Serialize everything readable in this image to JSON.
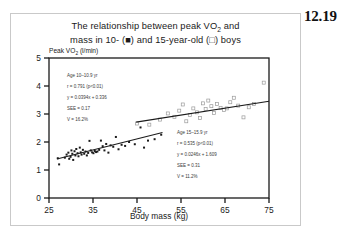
{
  "page": {
    "number_label": "12.19"
  },
  "figure": {
    "title_line1": "The relationship between peak VO",
    "title_line1_sub": "2",
    "title_line1_end": " and",
    "title_line2_a": "mass in 10- (",
    "title_line2_marker_filled": "■",
    "title_line2_b": ") and 15-year-old (",
    "title_line2_marker_open": "□",
    "title_line2_c": ") boys",
    "y_axis_label": "Peak VO",
    "y_axis_label_sub": "2",
    "y_axis_label_unit": " (l/min)",
    "x_axis_label": "Body mass (kg)"
  },
  "annotations": {
    "group_10yr": {
      "line1": "Age 10–10.9 yr",
      "line2": "r = 0.791 (p<0.01)",
      "line3": "y = 0.0394x + 0.336",
      "line4": "SEE = 0.17",
      "line5": "V = 16.2%"
    },
    "group_15yr": {
      "line1": "Age 15–15.9 yr",
      "line2": "r = 0.535 (p<0.01)",
      "line3": "y = 0.0246x + 1.609",
      "line4": "SEE = 0.31",
      "line5": "V = 11.2%"
    }
  },
  "chart_data": {
    "type": "scatter",
    "xlabel": "Body mass (kg)",
    "ylabel": "Peak VO2 (l/min)",
    "xlim": [
      25,
      75
    ],
    "ylim": [
      0,
      5
    ],
    "xticks": [
      25,
      35,
      45,
      55,
      65,
      75
    ],
    "yticks": [
      0,
      1,
      2,
      3,
      4,
      5
    ],
    "grid": false,
    "legend_position": "in-title",
    "series": [
      {
        "name": "Age 10-10.9 yr",
        "marker": "filled-square",
        "color": "#1a1a1a",
        "regression": {
          "slope": 0.0394,
          "intercept": 0.336,
          "r": 0.791,
          "p": "<0.01",
          "see": 0.17,
          "v_percent": 16.2,
          "x_start": 26.8,
          "x_end": 50.8
        },
        "points": [
          [
            27.0,
            1.42
          ],
          [
            27.3,
            1.2
          ],
          [
            28.6,
            1.44
          ],
          [
            29.0,
            1.55
          ],
          [
            29.4,
            1.62
          ],
          [
            29.6,
            1.4
          ],
          [
            29.9,
            1.47
          ],
          [
            30.1,
            1.7
          ],
          [
            30.3,
            1.58
          ],
          [
            30.5,
            1.36
          ],
          [
            30.8,
            1.67
          ],
          [
            31.0,
            1.52
          ],
          [
            31.2,
            1.75
          ],
          [
            31.5,
            1.6
          ],
          [
            31.7,
            1.49
          ],
          [
            32.0,
            1.8
          ],
          [
            32.2,
            1.63
          ],
          [
            32.4,
            1.55
          ],
          [
            32.7,
            1.72
          ],
          [
            33.0,
            1.58
          ],
          [
            33.3,
            1.66
          ],
          [
            33.6,
            1.52
          ],
          [
            33.9,
            1.61
          ],
          [
            34.2,
            2.04
          ],
          [
            34.5,
            1.7
          ],
          [
            34.8,
            1.63
          ],
          [
            35.1,
            1.6
          ],
          [
            35.4,
            1.68
          ],
          [
            35.7,
            1.64
          ],
          [
            36.0,
            1.66
          ],
          [
            36.4,
            1.72
          ],
          [
            36.8,
            2.05
          ],
          [
            37.2,
            1.85
          ],
          [
            37.6,
            1.7
          ],
          [
            38.0,
            1.93
          ],
          [
            38.5,
            1.62
          ],
          [
            39.0,
            1.88
          ],
          [
            39.6,
            1.83
          ],
          [
            40.2,
            2.18
          ],
          [
            40.8,
            1.74
          ],
          [
            41.5,
            1.9
          ],
          [
            42.3,
            1.86
          ],
          [
            43.2,
            2.0
          ],
          [
            44.5,
            1.92
          ],
          [
            45.8,
            2.52
          ],
          [
            46.6,
            1.8
          ],
          [
            47.5,
            2.05
          ],
          [
            49.0,
            2.1
          ],
          [
            50.5,
            2.26
          ]
        ]
      },
      {
        "name": "Age 15-15.9 yr",
        "marker": "open-square",
        "color": "#9a9a9a",
        "regression": {
          "slope": 0.0246,
          "intercept": 1.609,
          "r": 0.535,
          "p": "<0.01",
          "see": 0.31,
          "v_percent": 11.2,
          "x_start": 44.8,
          "x_end": 75.0
        },
        "points": [
          [
            45.0,
            2.66
          ],
          [
            47.8,
            2.62
          ],
          [
            50.2,
            2.8
          ],
          [
            52.0,
            3.02
          ],
          [
            53.5,
            2.9
          ],
          [
            54.6,
            3.12
          ],
          [
            55.4,
            3.34
          ],
          [
            56.2,
            2.74
          ],
          [
            57.0,
            2.96
          ],
          [
            57.8,
            3.2
          ],
          [
            58.6,
            3.06
          ],
          [
            59.3,
            2.86
          ],
          [
            60.0,
            3.38
          ],
          [
            60.6,
            3.18
          ],
          [
            61.2,
            3.48
          ],
          [
            61.9,
            3.28
          ],
          [
            62.5,
            3.04
          ],
          [
            63.2,
            3.36
          ],
          [
            64.0,
            3.22
          ],
          [
            64.8,
            3.14
          ],
          [
            65.4,
            3.2
          ],
          [
            66.2,
            3.42
          ],
          [
            67.0,
            3.58
          ],
          [
            68.0,
            3.3
          ],
          [
            69.2,
            2.88
          ],
          [
            70.4,
            3.24
          ],
          [
            71.6,
            3.36
          ],
          [
            73.8,
            4.12
          ]
        ]
      }
    ]
  }
}
